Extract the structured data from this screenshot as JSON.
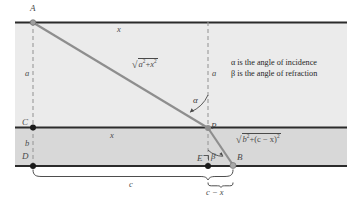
{
  "figure": {
    "type": "optics-refraction-diagram",
    "colors": {
      "upper_medium_fill": "#ebebeb",
      "lower_medium_fill": "#d9d9d9",
      "below_fill": "#ffffff",
      "boundary_line": "#2b2b2b",
      "ray": "#8a8a8a",
      "dashed_guide": "#9a9a9a",
      "text": "#1f1f1f",
      "label": "#4a4a4a"
    },
    "points": {
      "A": "A",
      "B": "B",
      "C": "C",
      "D": "D",
      "E": "E",
      "P": "P"
    },
    "segments": {
      "vertical_left_upper": "a",
      "vertical_left_lower": "b",
      "vertical_right_upper": "a",
      "horizontal_top": "x",
      "horizontal_middle": "x",
      "brace_full": "c",
      "brace_short": "c − x"
    },
    "formulas": {
      "incident_ray": {
        "radicand_first": "a",
        "radicand_first_exp": "2",
        "plus": "+",
        "radicand_second": "x",
        "radicand_second_exp": "2",
        "plain": "√(a² + x²)"
      },
      "refracted_ray": {
        "radicand_first": "b",
        "radicand_first_exp": "2",
        "plus": "+",
        "radicand_second_open": "(c − x)",
        "radicand_second_exp": "2",
        "plain": "√(b² + (c − x)²)"
      }
    },
    "angles": {
      "alpha_symbol": "α",
      "beta_symbol": "β"
    },
    "notes": [
      "α is the angle of incidence",
      "β is the angle of refraction"
    ],
    "note_lines": {
      "line1": "α is the angle of incidence",
      "line2": "β is the angle of refraction"
    }
  }
}
